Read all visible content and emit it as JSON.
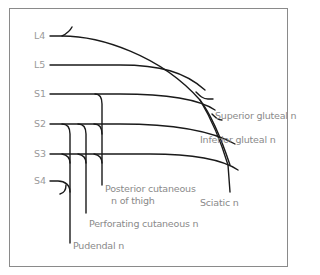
{
  "diagram": {
    "type": "nerve-plexus",
    "roots": [
      {
        "id": "L4",
        "label": "L4"
      },
      {
        "id": "L5",
        "label": "L5"
      },
      {
        "id": "S1",
        "label": "S1"
      },
      {
        "id": "S2",
        "label": "S2"
      },
      {
        "id": "S3",
        "label": "S3"
      },
      {
        "id": "S4",
        "label": "S4"
      }
    ],
    "nerves": {
      "superior_gluteal": "Superior gluteal n",
      "inferior_gluteal": "Inferior gluteal n",
      "sciatic": "Sciatic n",
      "posterior_cutaneous_line1": "Posterior cutaneous",
      "posterior_cutaneous_line2": "n of thigh",
      "perforating_cutaneous": "Perforating cutaneous n",
      "pudendal": "Pudendal n"
    },
    "colors": {
      "line": "#1a1a1a",
      "label": "#8a8a8a",
      "frame": "#8a8a8a"
    }
  }
}
